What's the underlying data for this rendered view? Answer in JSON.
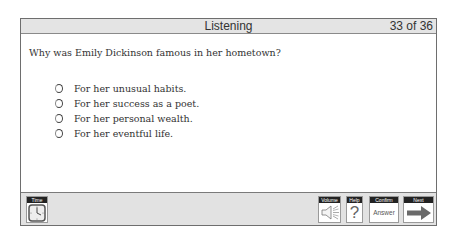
{
  "header": {
    "title": "Listening",
    "counter": "33 of 36"
  },
  "question": {
    "text": "Why was Emily Dickinson famous in her hometown?",
    "options": [
      {
        "label": "For her unusual habits.",
        "selected": false
      },
      {
        "label": "For her success as a poet.",
        "selected": false
      },
      {
        "label": "For her personal wealth.",
        "selected": false
      },
      {
        "label": "For her eventful life.",
        "selected": false
      }
    ]
  },
  "toolbar": {
    "time": {
      "caption": "Time",
      "icon": "clock-icon"
    },
    "volume": {
      "caption": "Volume",
      "icon": "speaker-icon"
    },
    "help": {
      "caption": "Help",
      "icon": "question-mark-icon",
      "glyph": "?"
    },
    "confirm": {
      "caption": "Confirm",
      "label": "Answer"
    },
    "next": {
      "caption": "Next",
      "icon": "right-arrow-icon"
    }
  },
  "colors": {
    "titlebar_bg": "#e4e4e4",
    "toolbar_bg": "#e2e2e2",
    "caption_bg": "#222222",
    "arrow": "#6a6a6a"
  }
}
